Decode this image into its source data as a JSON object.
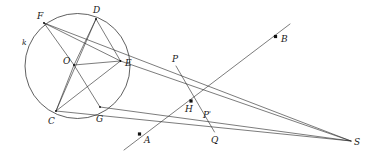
{
  "figure": {
    "kind": "euclidean-geometry-diagram",
    "background_color": "#ffffff",
    "ink_color": "#2b2b2b",
    "label_color": "#1a1a1a"
  },
  "circle": {
    "name": "k",
    "label": "k",
    "label_x": 22,
    "label_y": 45,
    "center_x": 77.5,
    "center_y": 66,
    "radius_x": 52.5,
    "radius_y": 52.5
  },
  "points": [
    {
      "id": "F",
      "label": "F",
      "x": 44.0,
      "y": 23.0,
      "label_x": 37.0,
      "label_y": 18.5,
      "marker": "tick"
    },
    {
      "id": "D",
      "label": "D",
      "x": 96.0,
      "y": 19.0,
      "label_x": 93.0,
      "label_y": 13.0,
      "marker": "tick"
    },
    {
      "id": "E",
      "label": "E",
      "x": 120.5,
      "y": 61.0,
      "label_x": 125.0,
      "label_y": 66.0,
      "marker": "tick"
    },
    {
      "id": "O",
      "label": "O",
      "x": 74.0,
      "y": 65.0,
      "label_x": 63.0,
      "label_y": 64.0,
      "marker": "tick"
    },
    {
      "id": "G",
      "label": "G",
      "x": 100.0,
      "y": 107.0,
      "label_x": 96.0,
      "label_y": 122.0,
      "marker": "tick"
    },
    {
      "id": "C",
      "label": "C",
      "x": 56.0,
      "y": 111.0,
      "label_x": 48.0,
      "label_y": 124.0,
      "marker": "tick"
    },
    {
      "id": "P",
      "label": "P",
      "x": 176.0,
      "y": 66.0,
      "label_x": 172.0,
      "label_y": 62.0,
      "marker": "none"
    },
    {
      "id": "H",
      "label": "H",
      "x": 191.0,
      "y": 101.0,
      "label_x": 185.0,
      "label_y": 112.0,
      "marker": "dot"
    },
    {
      "id": "Pp",
      "label": "P",
      "prime": "'",
      "x": 207.0,
      "y": 113.0,
      "label_x": 203.0,
      "label_y": 118.0,
      "marker": "none"
    },
    {
      "id": "Q",
      "label": "Q",
      "x": 214.5,
      "y": 132.0,
      "label_x": 211.0,
      "label_y": 143.0,
      "marker": "none"
    },
    {
      "id": "A",
      "label": "A",
      "x": 139.5,
      "y": 134.0,
      "label_x": 144.0,
      "label_y": 142.5,
      "marker": "dot"
    },
    {
      "id": "B",
      "label": "B",
      "x": 275.5,
      "y": 36.5,
      "label_x": 281.0,
      "label_y": 42.0,
      "marker": "dot"
    },
    {
      "id": "S",
      "label": "S",
      "x": 351.0,
      "y": 141.0,
      "label_x": 354.0,
      "label_y": 145.0,
      "marker": "none"
    }
  ],
  "segments": [
    {
      "name": "F-O",
      "x1": 44.0,
      "y1": 23.0,
      "x2": 74.0,
      "y2": 65.0
    },
    {
      "name": "O-G",
      "x1": 74.0,
      "y1": 65.0,
      "x2": 100.0,
      "y2": 107.0
    },
    {
      "name": "D-O",
      "x1": 96.0,
      "y1": 19.0,
      "x2": 74.0,
      "y2": 65.0
    },
    {
      "name": "O-C",
      "x1": 74.0,
      "y1": 65.0,
      "x2": 56.0,
      "y2": 111.0
    },
    {
      "name": "O-E",
      "x1": 74.0,
      "y1": 65.0,
      "x2": 120.5,
      "y2": 61.0
    },
    {
      "name": "D-E",
      "x1": 96.0,
      "y1": 19.0,
      "x2": 120.5,
      "y2": 61.0
    },
    {
      "name": "D-C",
      "x1": 96.0,
      "y1": 19.0,
      "x2": 56.0,
      "y2": 111.0
    },
    {
      "name": "F-E",
      "x1": 44.0,
      "y1": 23.0,
      "x2": 120.5,
      "y2": 61.0
    },
    {
      "name": "C-E",
      "x1": 56.0,
      "y1": 111.0,
      "x2": 120.5,
      "y2": 61.0
    },
    {
      "name": "F-to-S",
      "x1": 44.0,
      "y1": 23.0,
      "x2": 351.0,
      "y2": 141.0
    },
    {
      "name": "E-to-S",
      "x1": 120.5,
      "y1": 61.0,
      "x2": 351.0,
      "y2": 141.0
    },
    {
      "name": "C-to-S",
      "x1": 56.0,
      "y1": 111.0,
      "x2": 351.0,
      "y2": 141.0
    },
    {
      "name": "G-to-S",
      "x1": 100.0,
      "y1": 107.0,
      "x2": 351.0,
      "y2": 141.0
    },
    {
      "name": "P-to-Q",
      "x1": 176.0,
      "y1": 66.0,
      "x2": 214.5,
      "y2": 132.0
    },
    {
      "name": "A-B-ray",
      "x1": 124.0,
      "y1": 150.0,
      "x2": 290.0,
      "y2": 24.0
    }
  ],
  "labels_visible": [
    "k",
    "F",
    "D",
    "E",
    "O",
    "G",
    "C",
    "P",
    "H",
    "P'",
    "Q",
    "A",
    "B",
    "S"
  ]
}
